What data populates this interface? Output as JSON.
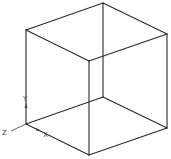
{
  "diagram": {
    "type": "wireframe-cube",
    "line_color": "#2a2a2a",
    "background": "#ffffff",
    "vertices": {
      "back_top": [
        103,
        3
      ],
      "left_top": [
        26,
        30
      ],
      "right_top": [
        167,
        34
      ],
      "front_top": [
        89,
        61
      ],
      "back_bottom": [
        103,
        97
      ],
      "left_bottom": [
        26,
        124
      ],
      "right_bottom": [
        167,
        128
      ],
      "front_bottom": [
        89,
        155
      ]
    }
  },
  "axis_indicator": {
    "y_label": "Y",
    "z_label": "Z",
    "x_label": "X"
  }
}
